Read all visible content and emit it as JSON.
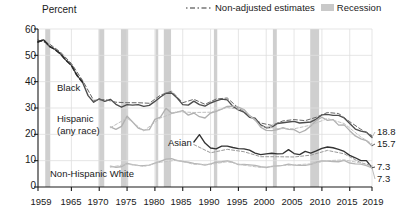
{
  "legend": {
    "items": [
      {
        "label": "Non-adjusted estimates",
        "marker": "dash-dot-line",
        "color": "#333333"
      },
      {
        "label": "Recession",
        "marker": "gray-band-swatch",
        "color": "#c9c9c9"
      }
    ]
  },
  "annotations": {
    "black": "Black",
    "hispanic_line1": "Hispanic",
    "hispanic_line2": "(any race)",
    "asian": "Asian",
    "white": "Non-Hispanic White"
  },
  "end_labels": [
    {
      "value": "18.8",
      "series": "Hispanic (any race)"
    },
    {
      "value": "15.7",
      "series": "Black"
    },
    {
      "value": "7.3",
      "series": "Asian"
    },
    {
      "value": "7.3",
      "series": "Non-Hispanic White"
    }
  ],
  "chart_data": {
    "type": "line",
    "title": "",
    "subtitle": "",
    "xlabel": "",
    "ylabel": "Percent",
    "ylim": [
      0,
      60
    ],
    "xlim": [
      1959,
      2019
    ],
    "ytick_labels": [
      "0",
      "10",
      "20",
      "30",
      "40",
      "50",
      "60"
    ],
    "yticks": [
      0,
      10,
      20,
      30,
      40,
      50,
      60
    ],
    "xtick_labels": [
      "1959",
      "1965",
      "1970",
      "1975",
      "1980",
      "1985",
      "1990",
      "1995",
      "2000",
      "2005",
      "2010",
      "2015",
      "2019"
    ],
    "xticks": [
      1959,
      1965,
      1970,
      1975,
      1980,
      1985,
      1990,
      1995,
      2000,
      2005,
      2010,
      2015,
      2019
    ],
    "grid": true,
    "legend_position": "top-right",
    "recessions": [
      {
        "start": 1960.3,
        "end": 1961.2
      },
      {
        "start": 1969.9,
        "end": 1970.9
      },
      {
        "start": 1973.9,
        "end": 1975.2
      },
      {
        "start": 1980.1,
        "end": 1980.6
      },
      {
        "start": 1981.6,
        "end": 1982.9
      },
      {
        "start": 1990.6,
        "end": 1991.2
      },
      {
        "start": 2001.2,
        "end": 2001.9
      },
      {
        "start": 2007.9,
        "end": 2009.5
      }
    ],
    "series": [
      {
        "name": "Black",
        "color": "#4d4d4d",
        "style": "solid",
        "x": [
          1959,
          1960,
          1961,
          1962,
          1963,
          1964,
          1965,
          1966,
          1967,
          1968,
          1969,
          1970,
          1971,
          1972,
          1973,
          1974,
          1975,
          1976,
          1977,
          1978,
          1979,
          1980,
          1981,
          1982,
          1983,
          1984,
          1985,
          1986,
          1987,
          1988,
          1989,
          1990,
          1991,
          1992,
          1993,
          1994,
          1995,
          1996,
          1997,
          1998,
          1999,
          2000,
          2001,
          2002,
          2003,
          2004,
          2005,
          2006,
          2007,
          2008,
          2009,
          2010,
          2011,
          2012,
          2013,
          2014,
          2015,
          2016,
          2017,
          2018,
          2019
        ],
        "y": [
          55.1,
          55.9,
          53.5,
          52.3,
          50.6,
          48.2,
          46.2,
          42.4,
          39.8,
          34.7,
          32.2,
          33.5,
          32.5,
          33.3,
          31.4,
          30.3,
          31.3,
          31.1,
          31.3,
          30.6,
          31.0,
          32.5,
          34.2,
          35.6,
          35.7,
          33.8,
          31.3,
          31.1,
          32.6,
          31.3,
          30.7,
          31.9,
          32.7,
          33.4,
          33.1,
          30.6,
          29.3,
          28.4,
          26.5,
          26.1,
          23.6,
          22.5,
          22.7,
          24.1,
          24.4,
          24.7,
          24.9,
          24.3,
          24.5,
          24.7,
          25.8,
          27.4,
          27.6,
          27.2,
          27.2,
          26.2,
          24.1,
          22.0,
          21.2,
          20.8,
          18.8
        ]
      },
      {
        "name": "Black non-adjusted",
        "color": "#666666",
        "style": "dashed",
        "x": [
          1959,
          1961,
          1963,
          1965,
          1967,
          1969,
          1971,
          1973,
          1975,
          1977,
          1979,
          1981,
          1983,
          1985,
          1987,
          1989,
          1991,
          1993,
          1995,
          1997,
          1999,
          2001,
          2003,
          2005,
          2007,
          2009,
          2011,
          2013,
          2015,
          2017,
          2019
        ],
        "y": [
          55.8,
          54.4,
          51.3,
          46.9,
          40.5,
          32.9,
          33.2,
          32.2,
          32.0,
          32.0,
          31.8,
          34.9,
          36.4,
          32.0,
          33.3,
          31.4,
          33.4,
          33.8,
          30.0,
          27.2,
          24.3,
          23.4,
          25.1,
          25.6,
          25.2,
          26.5,
          28.3,
          27.9,
          24.8,
          21.9,
          19.5
        ]
      },
      {
        "name": "Hispanic (any race)",
        "color": "#b0b0b0",
        "style": "solid",
        "x": [
          1972,
          1973,
          1974,
          1975,
          1976,
          1977,
          1978,
          1979,
          1980,
          1981,
          1982,
          1983,
          1984,
          1985,
          1986,
          1987,
          1988,
          1989,
          1990,
          1991,
          1992,
          1993,
          1994,
          1995,
          1996,
          1997,
          1998,
          1999,
          2000,
          2001,
          2002,
          2003,
          2004,
          2005,
          2006,
          2007,
          2008,
          2009,
          2010,
          2011,
          2012,
          2013,
          2014,
          2015,
          2016,
          2017,
          2018,
          2019
        ],
        "y": [
          22.8,
          21.9,
          23.0,
          26.9,
          24.7,
          22.4,
          21.6,
          21.8,
          25.7,
          26.5,
          29.9,
          28.0,
          28.4,
          29.0,
          27.3,
          28.1,
          26.7,
          26.2,
          28.1,
          28.7,
          29.6,
          30.6,
          30.7,
          30.3,
          29.4,
          27.1,
          25.6,
          22.7,
          21.5,
          21.4,
          21.8,
          22.5,
          21.9,
          21.8,
          20.6,
          21.5,
          23.2,
          25.3,
          26.5,
          25.3,
          25.6,
          23.5,
          23.6,
          21.4,
          19.4,
          18.3,
          17.6,
          15.7
        ]
      },
      {
        "name": "Hispanic non-adjusted",
        "color": "#c0c0c0",
        "style": "dashed",
        "x": [
          1972,
          1975,
          1978,
          1981,
          1984,
          1987,
          1990,
          1993,
          1996,
          1999,
          2002,
          2005,
          2008,
          2011,
          2014,
          2017,
          2019
        ],
        "y": [
          22.5,
          26.2,
          21.3,
          26.2,
          28.6,
          28.3,
          28.4,
          30.2,
          29.2,
          23.1,
          22.2,
          22.1,
          23.5,
          26.0,
          24.1,
          19.0,
          16.4
        ]
      },
      {
        "name": "Asian",
        "color": "#333333",
        "style": "solid",
        "x": [
          1987,
          1988,
          1989,
          1990,
          1991,
          1992,
          1993,
          1994,
          1995,
          1996,
          1997,
          1998,
          1999,
          2000,
          2001,
          2002,
          2003,
          2004,
          2005,
          2006,
          2007,
          2008,
          2009,
          2010,
          2011,
          2012,
          2013,
          2014,
          2015,
          2016,
          2017,
          2018,
          2019
        ],
        "y": [
          17.1,
          19.9,
          16.7,
          14.8,
          14.5,
          15.5,
          15.5,
          15.0,
          14.6,
          14.5,
          14.0,
          12.9,
          12.3,
          12.6,
          12.8,
          12.6,
          12.7,
          14.2,
          12.7,
          12.3,
          13.5,
          12.9,
          13.7,
          14.7,
          15.2,
          14.9,
          14.3,
          13.5,
          12.0,
          11.1,
          10.0,
          10.0,
          7.3
        ]
      },
      {
        "name": "Asian non-adjusted",
        "color": "#999999",
        "style": "dashed",
        "x": [
          1987,
          1990,
          1993,
          1996,
          1999,
          2002,
          2005,
          2008,
          2011,
          2014,
          2017,
          2019
        ],
        "y": [
          16.1,
          13.0,
          14.3,
          13.4,
          11.5,
          11.5,
          11.4,
          12.1,
          13.9,
          12.6,
          9.2,
          8.1
        ]
      },
      {
        "name": "Non-Hispanic White",
        "color": "#b5b5b5",
        "style": "solid",
        "x": [
          1972,
          1973,
          1974,
          1975,
          1976,
          1977,
          1978,
          1979,
          1980,
          1981,
          1982,
          1983,
          1984,
          1985,
          1986,
          1987,
          1988,
          1989,
          1990,
          1991,
          1992,
          1993,
          1994,
          1995,
          1996,
          1997,
          1998,
          1999,
          2000,
          2001,
          2002,
          2003,
          2004,
          2005,
          2006,
          2007,
          2008,
          2009,
          2010,
          2011,
          2012,
          2013,
          2014,
          2015,
          2016,
          2017,
          2018,
          2019
        ],
        "y": [
          7.9,
          7.5,
          7.7,
          9.0,
          8.5,
          8.2,
          8.1,
          8.3,
          9.1,
          9.7,
          10.6,
          10.8,
          10.0,
          9.7,
          9.4,
          9.0,
          8.7,
          8.3,
          8.8,
          9.4,
          9.6,
          9.9,
          9.4,
          8.5,
          8.6,
          8.4,
          8.2,
          7.7,
          7.4,
          7.8,
          8.0,
          8.2,
          8.7,
          8.3,
          8.2,
          8.2,
          8.6,
          9.4,
          9.9,
          9.8,
          9.7,
          9.6,
          10.1,
          9.1,
          8.8,
          8.7,
          8.1,
          7.3
        ]
      },
      {
        "name": "Non-Hispanic White non-adjusted",
        "color": "#c5c5c5",
        "style": "dashed",
        "x": [
          1972,
          1975,
          1978,
          1981,
          1984,
          1987,
          1990,
          1993,
          1996,
          1999,
          2002,
          2005,
          2008,
          2011,
          2014,
          2017,
          2019
        ],
        "y": [
          7.5,
          8.7,
          7.8,
          9.4,
          10.2,
          8.6,
          8.6,
          9.6,
          8.3,
          7.4,
          8.0,
          8.4,
          8.8,
          10.0,
          10.3,
          9.1,
          7.7
        ]
      }
    ]
  }
}
